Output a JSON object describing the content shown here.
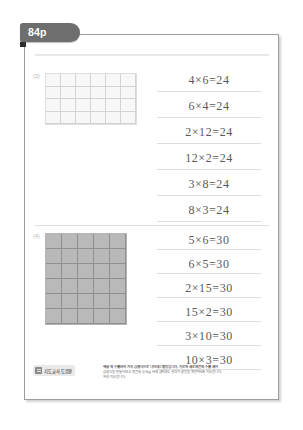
{
  "tab": {
    "label": "84p"
  },
  "problems": [
    {
      "number": "(3)",
      "grid": {
        "cols": 6,
        "rows": 4,
        "style": "light"
      },
      "answers": [
        "4×6=24",
        "6×4=24",
        "2×12=24",
        "12×2=24",
        "3×8=24",
        "8×3=24"
      ]
    },
    {
      "number": "(4)",
      "grid": {
        "cols": 5,
        "rows": 6,
        "style": "shaded"
      },
      "answers": [
        "5×6=30",
        "6×5=30",
        "2×15=30",
        "15×2=30",
        "3×10=30",
        "10×3=30"
      ]
    }
  ],
  "note": {
    "badge_label": "지도교사 도움말",
    "lines": [
      "해설 의 수를 여러 가지 곱셈식으로 나타내는 활동입니다. 가로와 세로의 칸의 수를 세어",
      "곱셈식을 만들어 보고 묶음의 순서를 바꿔 곱하여도 결과가 같음을 확인하도록 지도합니다.",
      "하여 지도합니다."
    ]
  },
  "colors": {
    "tab_bg": "#6e6e6e",
    "sheet_border": "#9d9d9d",
    "grid_light_fill": "#f7f7f7",
    "grid_shaded_fill": "#b9b9b9",
    "answer_text": "#59595b"
  }
}
